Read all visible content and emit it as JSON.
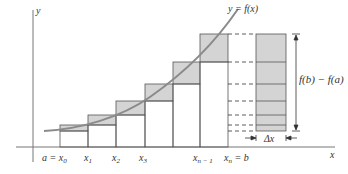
{
  "figure": {
    "curve_label": "y = f(x)",
    "y_axis_label": "y",
    "x_axis_label": "x",
    "diff_label": "f(b) − f(a)",
    "dx_label": "Δx",
    "tick_labels": [
      {
        "text": "a = x",
        "sub": "0",
        "x": 58
      },
      {
        "text": "x",
        "sub": "1",
        "x": 88
      },
      {
        "text": "x",
        "sub": "2",
        "x": 116
      },
      {
        "text": "x",
        "sub": "3",
        "x": 143
      },
      {
        "text": "x",
        "sub": "n − 1",
        "x": 198
      },
      {
        "text": "x",
        "sub": "n",
        "suffix": " = b",
        "x": 225
      }
    ],
    "colors": {
      "fill": "#d4d4d4",
      "stroke": "#555555",
      "curve": "#8a8a8a",
      "axis": "#666666"
    }
  }
}
